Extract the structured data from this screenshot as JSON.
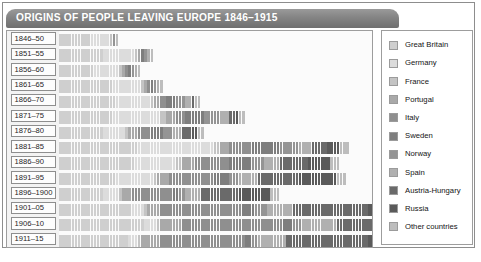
{
  "title": "ORIGINS OF PEOPLE LEAVING EUROPE 1846–1915",
  "colors": {
    "frame_border": "#8d8d8d",
    "title_bar": "#848484",
    "title_text": "#ffffff",
    "plot_background": "#fbfbfb",
    "legend_border": "#9d9d9d"
  },
  "legend": {
    "items": [
      {
        "label": "Great Britain",
        "color": "#cfcfcf"
      },
      {
        "label": "Germany",
        "color": "#dcdcdc"
      },
      {
        "label": "France",
        "color": "#c4c4c4"
      },
      {
        "label": "Portugal",
        "color": "#a9a9a9"
      },
      {
        "label": "Italy",
        "color": "#8f8f8f"
      },
      {
        "label": "Sweden",
        "color": "#7e7e7e"
      },
      {
        "label": "Norway",
        "color": "#949494"
      },
      {
        "label": "Spain",
        "color": "#b0b0b0"
      },
      {
        "label": "Austria-Hungary",
        "color": "#6a6a6a"
      },
      {
        "label": "Russia",
        "color": "#5a5a5a"
      },
      {
        "label": "Other countries",
        "color": "#bdbdbd"
      }
    ]
  },
  "chart_data": {
    "type": "bar",
    "title": "ORIGINS OF PEOPLE LEAVING EUROPE 1846–1915",
    "subtype": "isotype-pictogram",
    "xlabel": "",
    "ylabel": "",
    "unit_note": "each figure represents a fixed number of emigrants",
    "legend_position": "right",
    "grid": false,
    "categories": [
      "1846–50",
      "1851–55",
      "1856–60",
      "1861–65",
      "1866–70",
      "1871–75",
      "1876–80",
      "1881–85",
      "1886–90",
      "1891–95",
      "1896–1900",
      "1901–05",
      "1906–10",
      "1911–15"
    ],
    "series": [
      {
        "name": "Great Britain",
        "color": "#cfcfcf",
        "values": [
          10,
          14,
          11,
          17,
          18,
          17,
          14,
          25,
          24,
          18,
          14,
          23,
          27,
          22
        ]
      },
      {
        "name": "Germany",
        "color": "#dcdcdc",
        "values": [
          6,
          10,
          8,
          9,
          11,
          15,
          7,
          24,
          13,
          12,
          5,
          4,
          4,
          3
        ]
      },
      {
        "name": "France",
        "color": "#c4c4c4",
        "values": [
          1,
          1,
          1,
          1,
          1,
          2,
          1,
          2,
          2,
          1,
          1,
          1,
          1,
          1
        ]
      },
      {
        "name": "Portugal",
        "color": "#a9a9a9",
        "values": [
          0,
          1,
          1,
          1,
          2,
          3,
          3,
          3,
          4,
          4,
          3,
          4,
          7,
          6
        ]
      },
      {
        "name": "Italy",
        "color": "#8f8f8f",
        "values": [
          0,
          0,
          1,
          1,
          2,
          3,
          4,
          7,
          11,
          14,
          13,
          26,
          32,
          27
        ]
      },
      {
        "name": "Sweden",
        "color": "#7e7e7e",
        "values": [
          0,
          1,
          1,
          1,
          3,
          6,
          4,
          9,
          7,
          5,
          2,
          4,
          3,
          2
        ]
      },
      {
        "name": "Norway",
        "color": "#949494",
        "values": [
          1,
          1,
          1,
          1,
          3,
          5,
          3,
          6,
          4,
          3,
          2,
          4,
          3,
          2
        ]
      },
      {
        "name": "Spain",
        "color": "#b0b0b0",
        "values": [
          0,
          1,
          1,
          1,
          2,
          3,
          3,
          4,
          5,
          6,
          5,
          8,
          11,
          9
        ]
      },
      {
        "name": "Austria-Hungary",
        "color": "#6a6a6a",
        "values": [
          0,
          0,
          0,
          0,
          1,
          2,
          3,
          5,
          9,
          13,
          12,
          24,
          31,
          26
        ]
      },
      {
        "name": "Russia",
        "color": "#5a5a5a",
        "values": [
          0,
          0,
          0,
          0,
          0,
          1,
          2,
          4,
          7,
          12,
          10,
          18,
          21,
          18
        ]
      },
      {
        "name": "Other countries",
        "color": "#bdbdbd",
        "values": [
          1,
          1,
          1,
          1,
          2,
          2,
          2,
          3,
          3,
          3,
          3,
          5,
          6,
          5
        ]
      }
    ]
  }
}
